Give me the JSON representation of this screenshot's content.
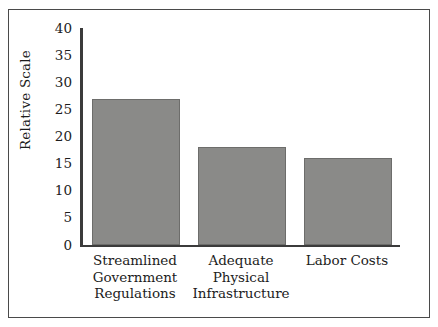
{
  "chart_data": {
    "type": "bar",
    "title": "",
    "subtitle": "",
    "xlabel": "",
    "ylabel": "Relative Scale",
    "categories": [
      "Streamlined Government Regulations",
      "Adequate Physical Infrastructure",
      "Labor Costs"
    ],
    "category_lines": [
      [
        "Streamlined",
        "Government",
        "Regulations"
      ],
      [
        "Adequate",
        "Physical",
        "Infrastructure"
      ],
      [
        "Labor Costs"
      ]
    ],
    "values": [
      27,
      18,
      16
    ],
    "ylim": [
      0,
      40
    ],
    "ytick_values": [
      40,
      35,
      30,
      25,
      20,
      15,
      10,
      5,
      0
    ],
    "ytick_labels": [
      "40",
      "35",
      "30",
      "25",
      "20",
      "15",
      "10",
      "5",
      "0"
    ],
    "grid": false,
    "legend": null,
    "legend_position": "none",
    "annotations": [],
    "colors": {
      "bar_fill": "#8a8a88",
      "bar_edge": "#6d6d6b",
      "axis": "#3b3b3b",
      "text": "#1c1c1c",
      "frame": "#4a4a4a",
      "background": "#ffffff"
    }
  }
}
